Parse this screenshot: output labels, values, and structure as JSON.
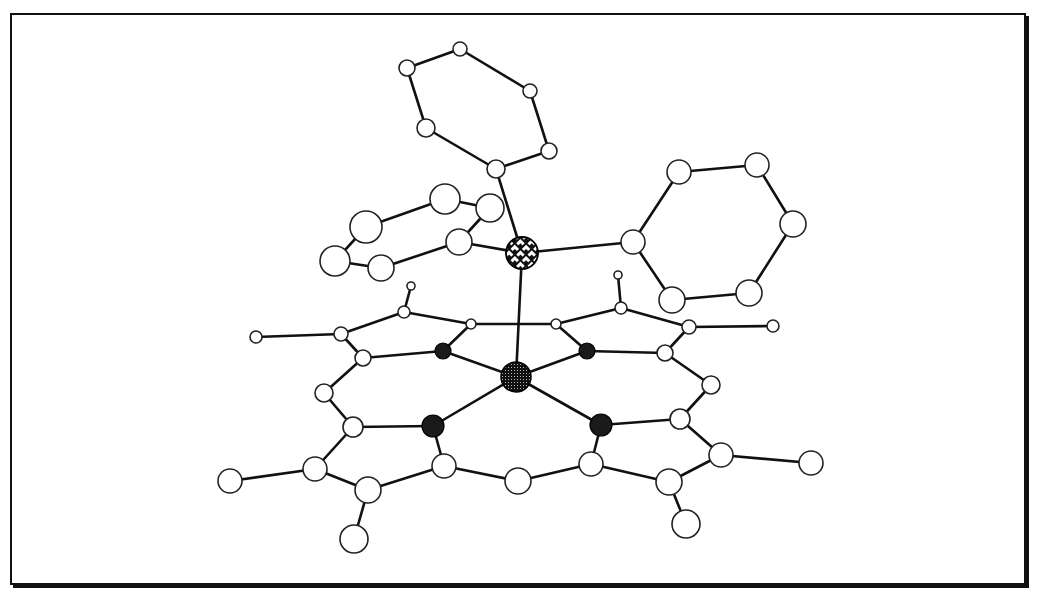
{
  "figure": {
    "type": "ball-and-stick molecular structure",
    "frame": {
      "border_color": "#111111",
      "background": "#ffffff"
    }
  },
  "atoms": {
    "phosphorus": {
      "x": 522,
      "y": 253,
      "r": 16,
      "style": "crosshatch"
    },
    "metal": {
      "x": 516,
      "y": 377,
      "r": 15,
      "style": "dotted"
    },
    "nitrogens": [
      {
        "x": 443,
        "y": 351,
        "r": 8
      },
      {
        "x": 587,
        "y": 351,
        "r": 8
      },
      {
        "x": 433,
        "y": 426,
        "r": 11
      },
      {
        "x": 601,
        "y": 425,
        "r": 11
      }
    ]
  },
  "legend": {
    "metal_label": "metal center",
    "phosphorus_label": "P",
    "nitrogen_label": "N",
    "carbon_label": "C"
  }
}
